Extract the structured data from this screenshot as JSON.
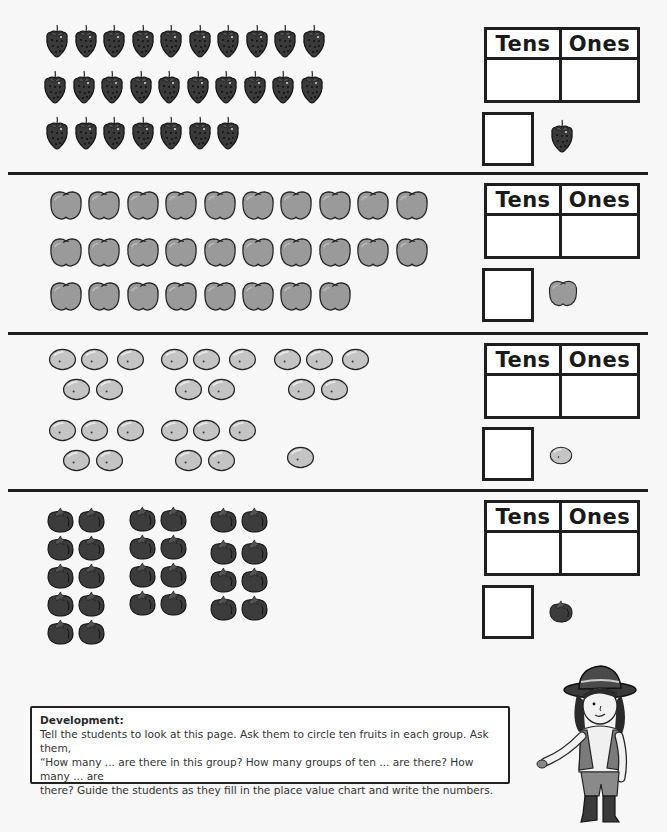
{
  "worksheet": {
    "sections": [
      {
        "fruit": "strawberry",
        "icon": "strawberry-icon",
        "count": 27,
        "rows": [
          10,
          10,
          7
        ],
        "table_headers": [
          "Tens",
          "Ones"
        ],
        "tens_value": "",
        "ones_value": "",
        "number_answer": ""
      },
      {
        "fruit": "apple",
        "icon": "apple-icon",
        "count": 28,
        "rows": [
          10,
          10,
          8
        ],
        "table_headers": [
          "Tens",
          "Ones"
        ],
        "tens_value": "",
        "ones_value": "",
        "number_answer": ""
      },
      {
        "fruit": "lemon",
        "icon": "lemon-icon",
        "count": 26,
        "groups_of": 5,
        "groups": 5,
        "extra": 1,
        "table_headers": [
          "Tens",
          "Ones"
        ],
        "tens_value": "",
        "ones_value": "",
        "number_answer": ""
      },
      {
        "fruit": "tomato",
        "icon": "tomato-icon",
        "count": 26,
        "columns": [
          10,
          8,
          8
        ],
        "table_headers": [
          "Tens",
          "Ones"
        ],
        "tens_value": "",
        "ones_value": "",
        "number_answer": ""
      }
    ]
  },
  "development": {
    "title": "Development:",
    "line1": "Tell the students to look at this page. Ask them to circle ten fruits in each group. Ask them,",
    "line2": "“How many ... are there in this group? How many groups of ten ... are there? How many ... are",
    "line3": "there? Guide the students as they fill in the place value chart and write the numbers."
  },
  "colors": {
    "background": "#f7f7f7",
    "strawberry": "#3a3a3a",
    "apple": "#9a9a9a",
    "lemon": "#c4c4c4",
    "tomato": "#3c3c3c",
    "line": "#1e1e1e"
  }
}
